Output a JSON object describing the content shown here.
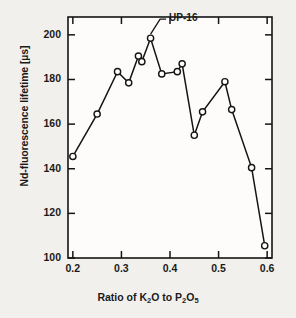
{
  "chart_data": {
    "type": "line",
    "title": "",
    "xlabel_parts": [
      {
        "t": "Ratio of K",
        "sub": false
      },
      {
        "t": "2",
        "sub": true
      },
      {
        "t": "O to P",
        "sub": false
      },
      {
        "t": "2",
        "sub": true
      },
      {
        "t": "O",
        "sub": false
      },
      {
        "t": "5",
        "sub": true
      }
    ],
    "xlabel": "Ratio of K2O to P2O5",
    "ylabel": "Nd-fluorescence lifetime [µs]",
    "xlim": [
      0.19,
      0.61
    ],
    "ylim": [
      100,
      208
    ],
    "xticks": [
      "0.2",
      "0.3",
      "0.4",
      "0.5",
      "0.6"
    ],
    "xtick_values": [
      0.2,
      0.3,
      0.4,
      0.5,
      0.6
    ],
    "yticks": [
      "100",
      "120",
      "140",
      "160",
      "180",
      "200"
    ],
    "ytick_values": [
      100,
      120,
      140,
      160,
      180,
      200
    ],
    "grid": false,
    "legend": "none",
    "marker": "open-circle",
    "line_color": "#141414",
    "marker_fill": "#ffffff",
    "x": [
      0.2,
      0.25,
      0.292,
      0.315,
      0.335,
      0.342,
      0.36,
      0.383,
      0.415,
      0.425,
      0.45,
      0.467,
      0.513,
      0.527,
      0.568,
      0.595
    ],
    "y": [
      145.5,
      164.5,
      183.5,
      178.5,
      190.5,
      188.0,
      198.5,
      182.5,
      183.5,
      187.0,
      155.0,
      165.5,
      179.0,
      166.5,
      140.5,
      105.5
    ],
    "annotations": [
      {
        "label": "UP-16",
        "points_to_x": 0.36,
        "points_to_y": 198.5,
        "text_x": 0.392,
        "text_y": 207.0
      }
    ]
  },
  "figure": {
    "background_color": "#f2f0ec",
    "plot_background_color": "#fdfcfa",
    "axis_color": "#141414"
  }
}
